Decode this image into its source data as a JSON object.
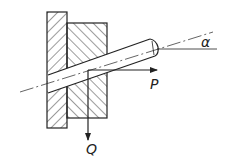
{
  "diagram": {
    "labels": {
      "angle": "α",
      "force_horizontal": "P",
      "force_vertical": "Q"
    },
    "colors": {
      "stroke": "#222222",
      "background": "#ffffff"
    }
  }
}
